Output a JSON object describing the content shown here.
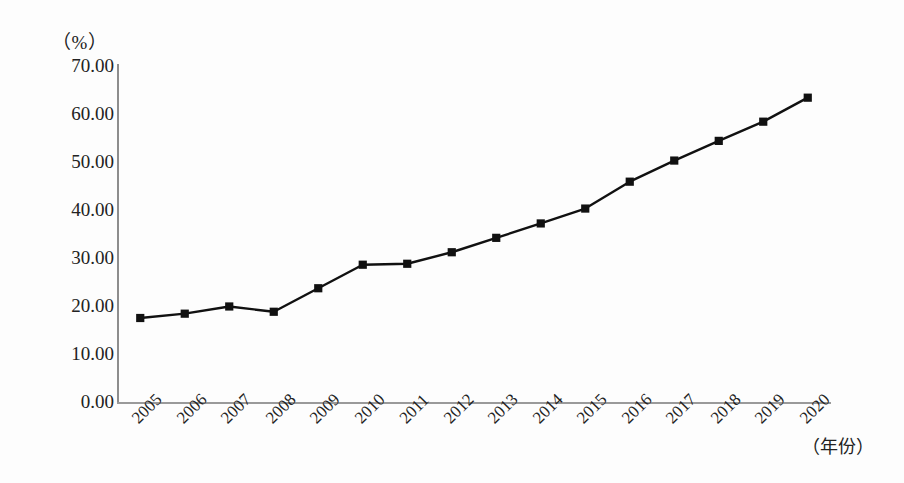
{
  "chart_data": {
    "type": "line",
    "title": "",
    "subtitle": "",
    "xlabel": "（年份）",
    "ylabel": "（%）",
    "unit_label": "（%）",
    "categories": [
      "2005",
      "2006",
      "2007",
      "2008",
      "2009",
      "2010",
      "2011",
      "2012",
      "2013",
      "2014",
      "2015",
      "2016",
      "2017",
      "2018",
      "2019",
      "2020"
    ],
    "values": [
      17.5,
      18.4,
      19.9,
      18.8,
      23.7,
      28.6,
      28.8,
      31.2,
      34.2,
      37.2,
      40.3,
      45.9,
      50.3,
      54.4,
      58.4,
      63.4
    ],
    "series": [
      {
        "name": "",
        "values": [
          17.5,
          18.4,
          19.9,
          18.8,
          23.7,
          28.6,
          28.8,
          31.2,
          34.2,
          37.2,
          40.3,
          45.9,
          50.3,
          54.4,
          58.4,
          63.4
        ]
      }
    ],
    "ylim": [
      0,
      70
    ],
    "ytick_step": 10,
    "ytick_labels": [
      "0.00",
      "10.00",
      "20.00",
      "30.00",
      "40.00",
      "50.00",
      "60.00",
      "70.00"
    ],
    "ytick_values": [
      0,
      10,
      20,
      30,
      40,
      50,
      60,
      70
    ],
    "xtick_rotation_deg": -45,
    "grid": false,
    "legend": false,
    "legend_position": "none",
    "marker": "square",
    "line_color": "#111111",
    "marker_color": "#111111",
    "axis_color": "#8d8d8d",
    "background_color": "#fdfdfd"
  }
}
